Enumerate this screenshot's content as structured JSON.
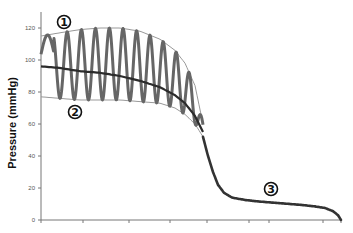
{
  "chart_data": {
    "type": "line",
    "title": "",
    "xlabel": "",
    "ylabel": "Pressure (mmHg)",
    "ylim": [
      0,
      130
    ],
    "yticks": [
      0,
      20,
      40,
      60,
      80,
      100,
      120
    ],
    "xticks_labeled": false,
    "grid": false,
    "legend": null,
    "x_range_px": [
      41,
      341
    ],
    "annotations": [
      {
        "label": "1",
        "x_px": 64,
        "y_px": 22,
        "meaning": "upper envelope (systolic)"
      },
      {
        "label": "2",
        "x_px": 75,
        "y_px": 112,
        "meaning": "lower envelope (diastolic)"
      },
      {
        "label": "3",
        "x_px": 271,
        "y_px": 189,
        "meaning": "post-deflation plateau"
      }
    ],
    "series": [
      {
        "name": "Upper envelope",
        "style": "thin-gray",
        "x_px": [
          41,
          60,
          80,
          100,
          120,
          140,
          160,
          175,
          185,
          195,
          203
        ],
        "values": [
          115,
          117,
          119,
          120,
          120,
          118,
          113,
          106,
          98,
          84,
          60
        ]
      },
      {
        "name": "Lower envelope",
        "style": "thin-gray",
        "x_px": [
          41,
          60,
          80,
          100,
          120,
          140,
          160,
          175,
          185,
          195,
          203
        ],
        "values": [
          77,
          76,
          75,
          75,
          75,
          74,
          73,
          70,
          66,
          60,
          52
        ]
      },
      {
        "name": "Mean pressure",
        "style": "thick-dark",
        "x_px": [
          41,
          60,
          80,
          100,
          120,
          140,
          160,
          175,
          185,
          195,
          203
        ],
        "values": [
          96,
          95,
          93,
          92,
          90,
          87,
          83,
          78,
          73,
          65,
          55
        ]
      },
      {
        "name": "Oscillating cuff pressure",
        "style": "thick-gray",
        "cycles": 11,
        "x_start_px": 41,
        "x_end_px": 203
      },
      {
        "name": "Deflation tail",
        "style": "thick-dark",
        "x_px": [
          203,
          208,
          213,
          218,
          224,
          232,
          245,
          260,
          280,
          300,
          315,
          325,
          333,
          338,
          341
        ],
        "values": [
          52,
          40,
          30,
          22,
          17,
          14,
          12.5,
          11.5,
          10.5,
          9.5,
          8.5,
          7.5,
          5.5,
          3,
          0
        ]
      }
    ],
    "x_tick_px": [
      41,
      83,
      129,
      170,
      207,
      249,
      269,
      323,
      341
    ]
  },
  "axis": {
    "ylabel": "Pressure (mmHg)",
    "ytick_labels": [
      "0",
      "20",
      "40",
      "60",
      "80",
      "100",
      "120"
    ]
  },
  "markers": [
    "①",
    "②",
    "③"
  ]
}
